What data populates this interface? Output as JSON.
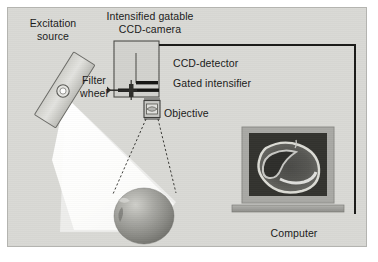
{
  "figure": {
    "kind": "optical-instrument-schematic"
  },
  "labels": {
    "excitation_source": "Excitation\nsource",
    "camera_title": "Intensified gatable\nCCD-camera",
    "filter_wheel": "Filter\nwheel",
    "ccd_detector": "CCD-detector",
    "gated_intensifier": "Gated intensifier",
    "objective": "Objective",
    "computer": "Computer"
  },
  "components": {
    "lamp": {
      "name": "excitation-lamp-housing",
      "shape": "tilted-rectangle"
    },
    "lamp_lens": {
      "name": "lamp-output-lens",
      "shape": "circle"
    },
    "light_cone": {
      "name": "excitation-light-cone",
      "color": "#fdfdfb"
    },
    "camera_body": {
      "name": "ccd-camera-body",
      "shape": "rectangle"
    },
    "filter_wheel_bar": {
      "name": "filter-wheel-mechanism",
      "shape": "horizontal-bar"
    },
    "objective_lens": {
      "name": "objective-lens-module",
      "shape": "boxed-lens"
    },
    "specimen": {
      "name": "apple-specimen",
      "shape": "sphere"
    },
    "fov_lines": {
      "name": "field-of-view-lines",
      "style": "dashed"
    },
    "data_cable": {
      "name": "camera-to-computer-cable",
      "color": "#1a1a1a"
    },
    "monitor": {
      "name": "computer-monitor",
      "screen_content": "fluorescence-image-of-apple"
    }
  },
  "colors": {
    "panel_background": "#d9d9d5",
    "panel_border": "#b4b4b0",
    "text": "#1a1a1a",
    "cable": "#1a1a1a",
    "light_cone": "#fdfdfb",
    "monitor_bezel": "#a8a8a4",
    "monitor_screen": "#3a3a38",
    "specimen_mid": "#9a9a96"
  }
}
